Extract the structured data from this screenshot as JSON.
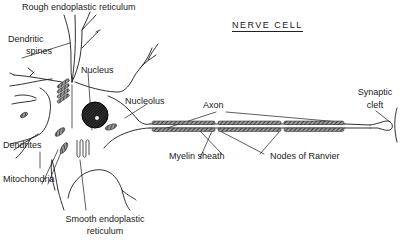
{
  "title": "NERVE CELL",
  "colors": {
    "background": "#ffffff",
    "ink": "#1a1a1a"
  },
  "labels": {
    "rough_er": "Rough endoplastic reticulum",
    "dendritic_spines_1": "Dendritic",
    "dendritic_spines_2": "spines",
    "nucleus": "Nucleus",
    "nucleolus": "Nucleolus",
    "dendrites": "Dendrites",
    "mitochondria": "Mitochondria",
    "smooth_er_1": "Smooth endoplastic",
    "smooth_er_2": "reticulum",
    "axon": "Axon",
    "myelin_sheath": "Myelin sheath",
    "nodes_of_ranvier": "Nodes of Ranvier",
    "synaptic_cleft_1": "Synaptic",
    "synaptic_cleft_2": "cleft"
  }
}
